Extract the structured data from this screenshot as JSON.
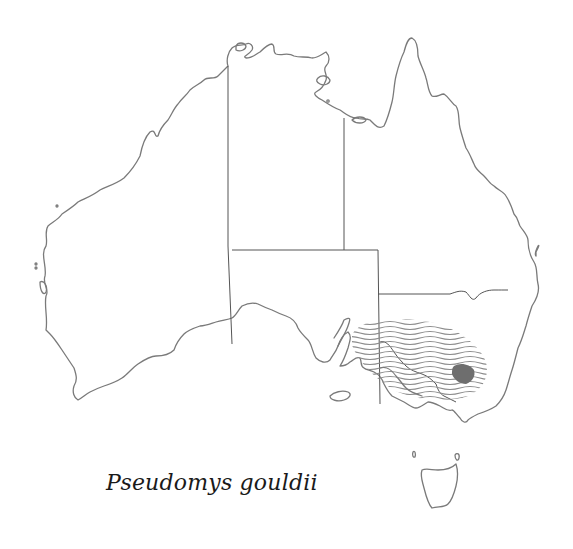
{
  "map": {
    "title": "Pseudomys gouldii",
    "region": "Australia",
    "colors": {
      "background": "#ffffff",
      "coastline": "#7a7a7a",
      "state_borders": "#555555",
      "range_hatch": "#8c8c8c",
      "core_range": "#6e6e6e"
    },
    "legend": {
      "hatched_area": "historical / former range",
      "solid_area": "current / known range"
    }
  }
}
